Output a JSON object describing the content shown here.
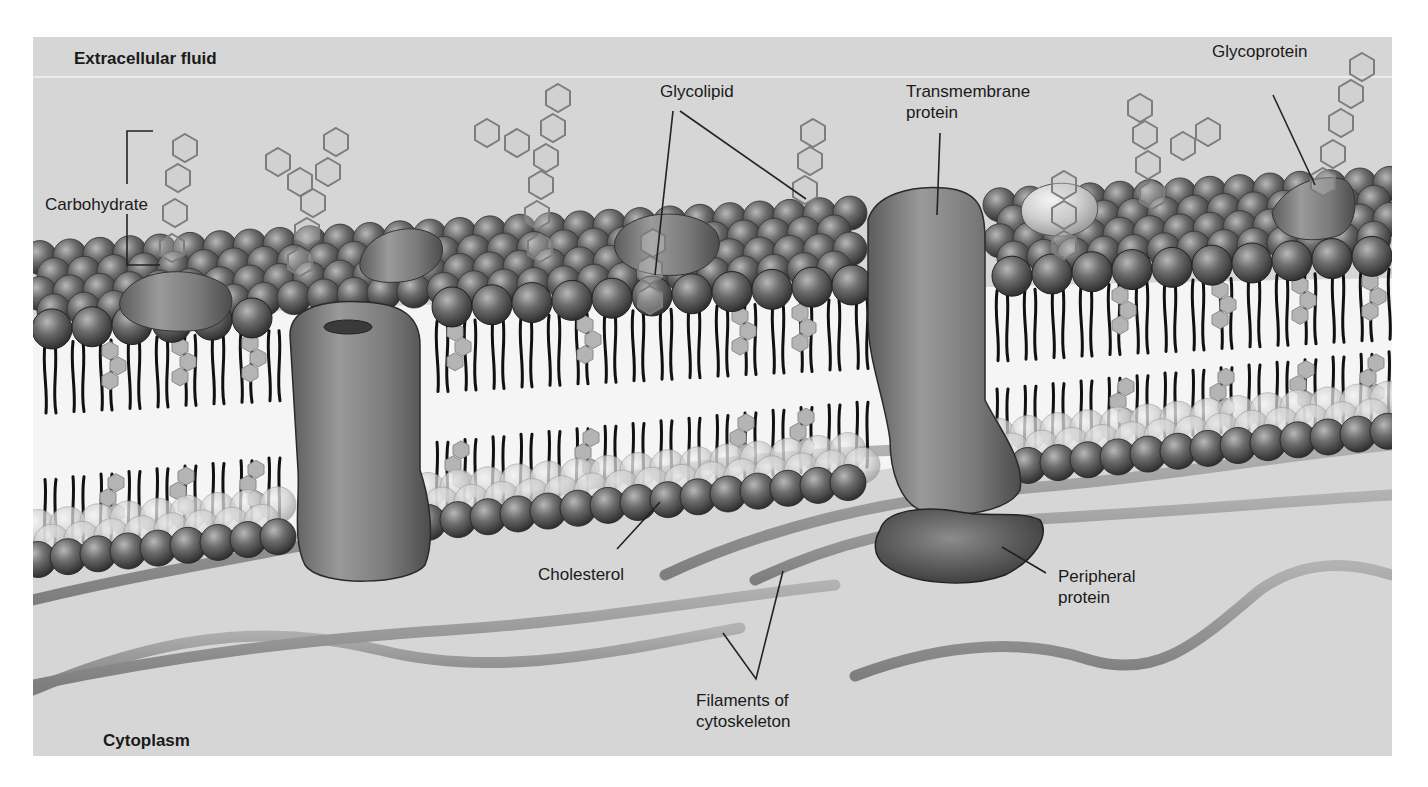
{
  "figure": {
    "colors": {
      "background_page": "#ffffff",
      "panel_fill": "#d6d6d6",
      "separator_line": "#f2f2f2",
      "bilayer_core": "#f4f4f4",
      "phospholipid_head_dark": "#5a5a5a",
      "phospholipid_head_light": "#bdbdbd",
      "tail": "#111111",
      "protein": "#7a7a7a",
      "peripheral_protein": "#555555",
      "carbohydrate_stroke": "#7d7d7d",
      "filament": "#9a9a9a",
      "label_text": "#1a1a1a",
      "leader_line": "#222222"
    }
  },
  "regions": {
    "top": {
      "label": "Extracellular fluid"
    },
    "bottom": {
      "label": "Cytoplasm"
    }
  },
  "labels": [
    {
      "id": "carbohydrate",
      "text": "Carbohydrate",
      "x": 45,
      "y": 194
    },
    {
      "id": "glycolipid",
      "text": "Glycolipid",
      "x": 660,
      "y": 81
    },
    {
      "id": "transmembrane-protein",
      "text": "Transmembrane\nprotein",
      "x": 906,
      "y": 81
    },
    {
      "id": "glycoprotein",
      "text": "Glycoprotein",
      "x": 1212,
      "y": 10
    },
    {
      "id": "cholesterol",
      "text": "Cholesterol",
      "x": 538,
      "y": 565
    },
    {
      "id": "peripheral-protein",
      "text": "Peripheral\nprotein",
      "x": 1058,
      "y": 567
    },
    {
      "id": "filaments-of-cytoskeleton",
      "text": "Filaments of\ncytoskeleton",
      "x": 696,
      "y": 691
    }
  ],
  "components": [
    "phospholipid-bilayer",
    "channel-protein",
    "transmembrane-protein",
    "peripheral-protein",
    "glycoprotein",
    "glycolipid",
    "cholesterol",
    "carbohydrate-chains",
    "cytoskeleton-filaments"
  ]
}
